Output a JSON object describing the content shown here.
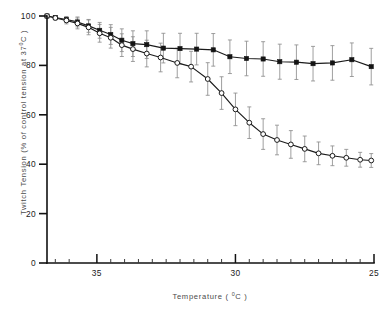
{
  "chart_data": {
    "type": "line",
    "title": "",
    "xlabel": "Temperature ( °C )",
    "ylabel": "Twitch Tension (% of control tension at 37°C)",
    "xlim": [
      36.8,
      25.0
    ],
    "ylim": [
      0,
      100
    ],
    "x_reversed": true,
    "grid": false,
    "legend_position": "none",
    "x_major_ticks": [
      35,
      30,
      25
    ],
    "x_major_tick_labels": [
      "35",
      "30",
      "25"
    ],
    "x_minor_ticks": [
      36.5,
      36.0,
      34.5,
      34.0,
      33.5,
      33.0,
      32.5,
      32.0,
      31.5,
      31.0,
      30.5,
      29.5,
      29.0,
      28.5,
      28.0,
      27.5,
      27.0,
      26.5,
      26.0,
      25.5
    ],
    "y_ticks": [
      0,
      20,
      40,
      60,
      80,
      100
    ],
    "y_tick_labels": [
      "0",
      "20",
      "40",
      "60",
      "80",
      "100"
    ],
    "x": [
      36.8,
      36.4,
      36.0,
      35.6,
      35.2,
      34.8,
      34.4,
      34.0,
      33.6,
      33.2,
      32.8,
      32.4,
      32.0,
      31.6,
      31.2,
      30.8,
      30.4,
      30.0,
      29.6,
      29.2,
      28.8,
      28.4,
      28.0,
      27.6,
      27.2,
      26.8,
      26.4,
      26.0,
      25.6,
      25.2,
      25.0
    ],
    "series": [
      {
        "name": "upper-series",
        "marker": "filled-square",
        "values": [
          100.0,
          99.4,
          98.6,
          97.6,
          96.0,
          94.2,
          92.5,
          90.2,
          88.8,
          88.4,
          87.0,
          86.8,
          86.6,
          86.3,
          83.5,
          82.8,
          82.6,
          81.5,
          81.3,
          80.7,
          81.0,
          82.3,
          79.5
        ],
        "x": [
          36.8,
          36.5,
          36.1,
          35.7,
          35.3,
          34.9,
          34.5,
          34.1,
          33.7,
          33.2,
          32.6,
          32.0,
          31.4,
          30.8,
          30.2,
          29.6,
          29.0,
          28.4,
          27.8,
          27.2,
          26.5,
          25.8,
          25.1
        ],
        "errors": [
          0.0,
          0.8,
          1.2,
          2.0,
          2.6,
          3.2,
          4.0,
          4.6,
          5.2,
          5.6,
          6.0,
          6.2,
          6.4,
          6.6,
          6.8,
          7.0,
          7.0,
          7.1,
          7.0,
          7.0,
          7.0,
          6.8,
          7.4
        ]
      },
      {
        "name": "lower-series",
        "marker": "open-circle",
        "values": [
          100.0,
          99.2,
          98.2,
          97.0,
          95.4,
          93.0,
          91.2,
          88.2,
          86.6,
          84.8,
          83.2,
          81.0,
          79.5,
          74.5,
          68.8,
          62.2,
          56.8,
          52.2,
          49.8,
          48.0,
          46.2,
          44.4,
          43.4,
          42.6,
          41.8,
          41.5
        ],
        "x": [
          36.8,
          36.5,
          36.1,
          35.7,
          35.3,
          34.9,
          34.5,
          34.1,
          33.7,
          33.2,
          32.7,
          32.1,
          31.6,
          31.0,
          30.5,
          30.0,
          29.5,
          29.0,
          28.5,
          28.0,
          27.5,
          27.0,
          26.5,
          26.0,
          25.5,
          25.1
        ],
        "errors": [
          0.0,
          0.8,
          1.4,
          2.2,
          3.0,
          3.6,
          4.2,
          4.6,
          5.0,
          5.4,
          5.8,
          6.0,
          6.2,
          6.6,
          6.6,
          6.6,
          6.4,
          6.2,
          6.0,
          5.6,
          5.2,
          4.6,
          4.0,
          3.4,
          3.0,
          2.8
        ]
      }
    ]
  },
  "axes": {
    "y_label_text": "Twitch Tension",
    "y_label_paren_open": "(% of control tension at 37",
    "y_label_degree": "0",
    "y_label_paren_close": "C )",
    "x_label_text": "Temperature (",
    "x_label_degree": "0",
    "x_label_close": "C )"
  },
  "colors": {
    "axis": "#111111",
    "line": "#1b1b1b",
    "error_bar": "#8e8e8e",
    "marker_filled": "#141414",
    "marker_open_fill": "#ffffff",
    "background": "#ffffff",
    "label_text": "#4a4a4a"
  }
}
